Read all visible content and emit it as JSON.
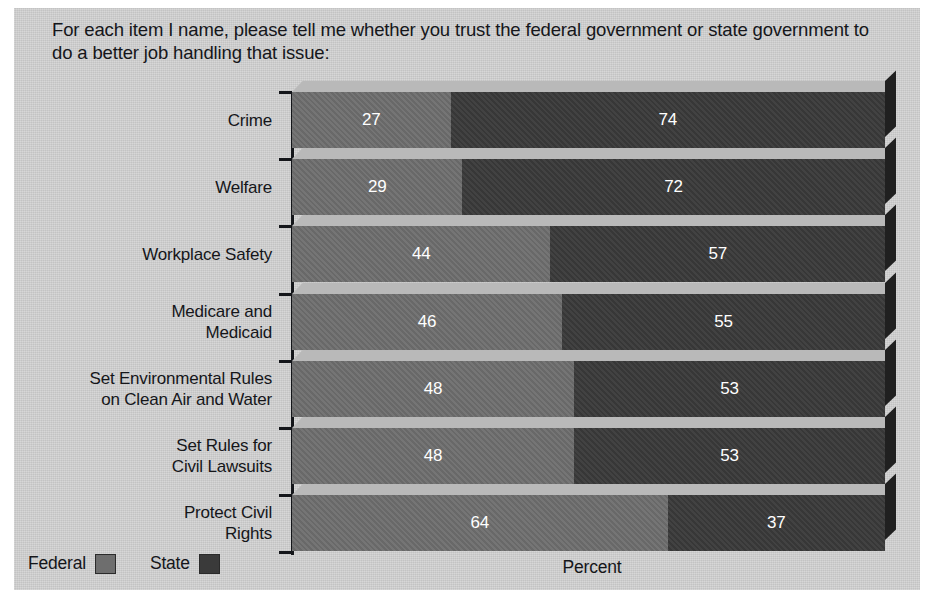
{
  "chart_data": {
    "type": "bar",
    "subtype": "stacked-horizontal-3d",
    "title": "For each item I name, please tell me whether you trust the federal government or state government to do a better job handling that issue:",
    "xlabel": "Percent",
    "ylabel": "",
    "grid": false,
    "legend_position": "bottom-left",
    "categories": [
      "Crime",
      "Welfare",
      "Workplace Safety",
      "Medicare and\nMedicaid",
      "Set Environmental Rules\non Clean Air and Water",
      "Set Rules for\nCivil Lawsuits",
      "Protect Civil\nRights"
    ],
    "series": [
      {
        "name": "Federal",
        "color": "#6e6e6e",
        "values": [
          27,
          29,
          44,
          46,
          48,
          48,
          64
        ]
      },
      {
        "name": "State",
        "color": "#3a3a3a",
        "values": [
          74,
          72,
          57,
          55,
          53,
          53,
          37
        ]
      }
    ],
    "xlim": [
      0,
      101
    ],
    "note": "Bars are stacked to a constant total width; segment labels show the raw percent for each side."
  },
  "legend": {
    "items": [
      {
        "label": "Federal",
        "color": "#6e6e6e"
      },
      {
        "label": "State",
        "color": "#3a3a3a"
      }
    ]
  },
  "axis": {
    "x_title": "Percent"
  },
  "colors": {
    "panel_background": "#d3d3d3",
    "page_background": "#ffffff",
    "axis": "#14161a",
    "text": "#15161a",
    "value_text": "#ffffff",
    "bar_top_bevel": "#b9b9b9",
    "bar_side_bevel": "#202020"
  }
}
